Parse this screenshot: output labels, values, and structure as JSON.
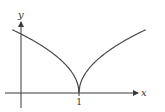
{
  "chart_data": {
    "type": "line",
    "title": "",
    "xlabel": "x",
    "ylabel": "y",
    "x_ticks": [
      1
    ],
    "x_tick_labels": [
      "1"
    ],
    "xlim": [
      -0.28,
      2.2
    ],
    "ylim": [
      -0.25,
      1.45
    ],
    "grid": false,
    "series": [
      {
        "name": "y = sqrt(|x - 1|)",
        "function": "sqrt(abs(x-1))",
        "x": [
          -0.15,
          0,
          0.25,
          0.5,
          0.75,
          0.9,
          1.0,
          1.1,
          1.25,
          1.5,
          1.75,
          2.0,
          2.15
        ],
        "values": [
          1.07,
          1.0,
          0.87,
          0.71,
          0.5,
          0.32,
          0.0,
          0.32,
          0.5,
          0.71,
          0.87,
          1.0,
          1.07
        ]
      }
    ]
  }
}
